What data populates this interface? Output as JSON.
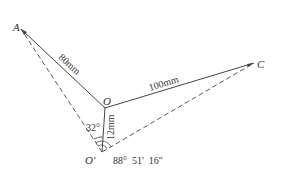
{
  "diagram": {
    "type": "linkage-geometry",
    "colors": {
      "line": "#444444",
      "text": "#333333",
      "background": "#ffffff"
    },
    "points": {
      "A": {
        "label": "A",
        "x": 21,
        "y": 29
      },
      "O": {
        "label": "O",
        "x": 105,
        "y": 108
      },
      "C": {
        "label": "C",
        "x": 254,
        "y": 63
      },
      "O_prime": {
        "label": "O'",
        "x": 102,
        "y": 152
      }
    },
    "segments": {
      "OA": {
        "from": "O",
        "to": "A",
        "style": "solid",
        "length_label": "80mm"
      },
      "OC": {
        "from": "O",
        "to": "C",
        "style": "solid",
        "length_label": "100mm"
      },
      "OOp": {
        "from": "O",
        "to": "O'",
        "style": "solid",
        "length_label": "12mm"
      },
      "OpA": {
        "from": "O'",
        "to": "A",
        "style": "dashed"
      },
      "OpC": {
        "from": "O'",
        "to": "C",
        "style": "dashed"
      }
    },
    "angles": {
      "left": {
        "label": "32°",
        "between": [
          "O'A",
          "O'O"
        ]
      },
      "right": {
        "label": "88°  51'  16\"",
        "between": [
          "O'A",
          "O'C"
        ]
      }
    }
  }
}
